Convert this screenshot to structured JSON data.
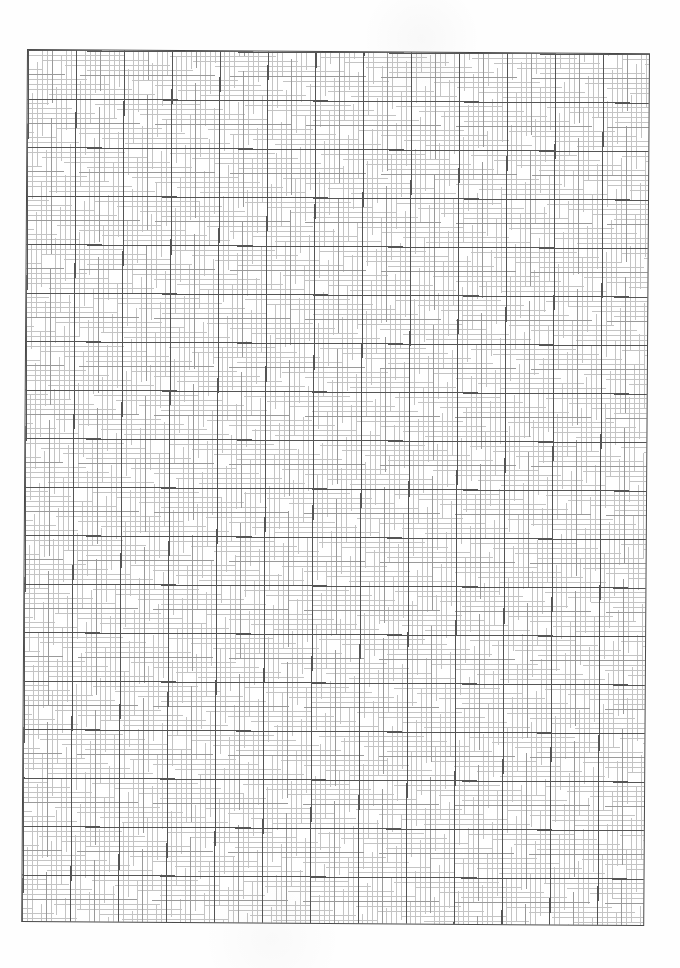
{
  "document": {
    "type": "graph-paper",
    "background_color": "#ffffff",
    "grid": {
      "major_columns": 13,
      "major_rows": 18,
      "minor_divisions_per_major": 10,
      "medium_divisions_per_major": 2,
      "colors": {
        "border": "#4a4a4a",
        "major_line": "#555555",
        "medium_line": "#9a9a9a",
        "minor_line": "#c4c4c4"
      }
    },
    "text_content": []
  }
}
